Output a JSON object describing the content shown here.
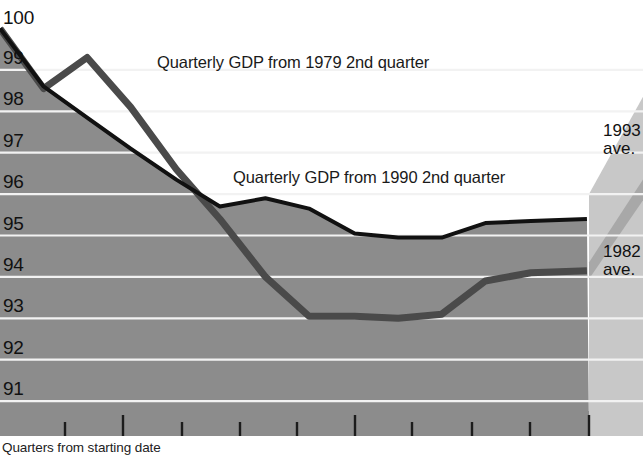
{
  "chart_data": {
    "type": "line",
    "title": "",
    "xlabel": "Quarters from starting date",
    "ylabel": "",
    "ylim": [
      90.3,
      100
    ],
    "xlim": [
      0,
      14.2
    ],
    "yticks": [
      100,
      99,
      98,
      97,
      96,
      95,
      94,
      93,
      92,
      91
    ],
    "ytick_labels": [
      "100",
      "99",
      "98",
      "97",
      "96",
      "95",
      "94",
      "93",
      "92",
      "91"
    ],
    "grid": true,
    "grid_color": "#f2f2f2",
    "plot_fill": "#8c8c8c",
    "projection_fill": "#c8c8c8",
    "xtick_positions": [
      1,
      2,
      3,
      4,
      5,
      6,
      7,
      8,
      9,
      10
    ],
    "xtick_labels": [
      "",
      "",
      "",
      "",
      "",
      "",
      "",
      "",
      "",
      ""
    ],
    "legend_position": "inline-annotations",
    "series": [
      {
        "name": "Quarterly GDP from 1979 2nd quarter",
        "color": "#4a4a4a",
        "width": 7,
        "x": [
          0.0,
          1.05,
          2.1,
          3.15,
          4.25,
          5.3,
          6.4,
          7.45,
          8.55,
          9.6,
          10.65,
          11.7,
          12.8,
          14.15
        ],
        "y": [
          100.0,
          98.55,
          99.3,
          98.1,
          96.6,
          95.4,
          94.0,
          93.05,
          93.05,
          93.0,
          93.1,
          93.9,
          94.1,
          94.15
        ]
      },
      {
        "name": "Quarterly GDP from 1990 2nd quarter",
        "color": "#111111",
        "width": 4,
        "x": [
          0.0,
          1.05,
          2.1,
          3.15,
          4.25,
          5.3,
          6.4,
          7.45,
          8.55,
          9.6,
          10.65,
          11.7,
          12.8,
          14.15
        ],
        "y": [
          100.0,
          98.6,
          97.85,
          97.1,
          96.35,
          95.7,
          95.9,
          95.65,
          95.05,
          94.95,
          94.95,
          95.3,
          95.35,
          95.4
        ]
      }
    ],
    "annotations": [
      {
        "name": "series-label-1979",
        "text": "Quarterly GDP from 1979 2nd quarter",
        "x_px": 157,
        "y_px": 53
      },
      {
        "name": "series-label-1990",
        "text": "Quarterly GDP from 1990 2nd quarter",
        "x_px": 233,
        "y_px": 168
      }
    ],
    "side_labels": [
      {
        "name": "projection-1993",
        "line1": "1993",
        "line2": "ave.",
        "value": 96.5,
        "x_px": 603,
        "y_px": 122
      },
      {
        "name": "projection-1982",
        "line1": "1982",
        "line2": "ave.",
        "value": 94.2,
        "x_px": 603,
        "y_px": 243
      }
    ]
  },
  "axis": {
    "caption": "Quarters from starting date"
  }
}
